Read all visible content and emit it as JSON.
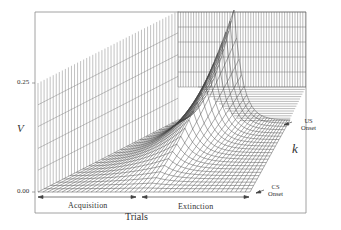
{
  "chart_data": {
    "type": "surface3d",
    "title": "",
    "axes": {
      "x": {
        "label": "Trials",
        "phases": [
          "Acquisition",
          "Extinction"
        ]
      },
      "y": {
        "label": "k",
        "annotations": [
          "CS Onset",
          "US Onset"
        ]
      },
      "z": {
        "label": "V",
        "ticks": [
          "0.00",
          "0.25"
        ],
        "zlim": [
          0.0,
          0.25
        ]
      }
    },
    "series": [
      {
        "name": "V(k) at US onset",
        "trials_phase": [
          "acq_start",
          "acq_mid",
          "acq_end",
          "ext_mid",
          "ext_end"
        ],
        "values": [
          0.0,
          0.12,
          0.25,
          0.05,
          0.01
        ]
      },
      {
        "name": "V(k) at CS onset",
        "trials_phase": [
          "acq_start",
          "acq_mid",
          "acq_end",
          "ext_mid",
          "ext_end"
        ],
        "values": [
          0.0,
          0.02,
          0.08,
          0.02,
          0.0
        ]
      }
    ],
    "grid": true,
    "legend": null
  },
  "labels": {
    "z_axis": "V",
    "z_tick_top": "0.25",
    "z_tick_bottom": "0.00",
    "depth_axis": "k",
    "x_axis": "Trials",
    "phase_acquisition": "Acquisition",
    "phase_extinction": "Extinction",
    "us_onset_line1": "US",
    "us_onset_line2": "Onset",
    "cs_onset_line1": "CS",
    "cs_onset_line2": "Onset"
  },
  "colors": {
    "line": "#555555",
    "frame": "#888888",
    "background": "#ffffff"
  }
}
